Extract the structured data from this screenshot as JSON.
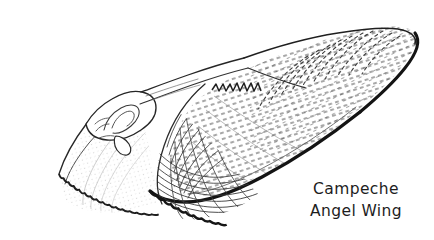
{
  "illustration": {
    "subject": "Campeche Angel Wing",
    "kind": "pen-and-ink bivalve shell illustration",
    "background_color": "#ffffff",
    "ink_color": "#1a1a1a",
    "stipple_color": "#3a3a3a",
    "fill_color": "#ffffff"
  },
  "caption": {
    "line1": "Campeche",
    "line2": "Angel Wing"
  },
  "figure_parts": {
    "left_valve": "left-valve",
    "right_valve": "right-valve",
    "umbo": "umbo-hinge",
    "dorsal_margin": "dorsal-margin",
    "ventral_margin": "ventral-margin",
    "growth_lines": "concentric-growth-lines",
    "radial_texture": "radial-stipple-texture",
    "crenulated_edge": "crenulated-shell-edge"
  }
}
